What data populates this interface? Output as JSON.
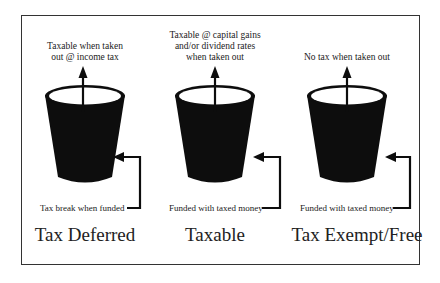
{
  "diagram": {
    "columns": [
      {
        "id": "tax-deferred",
        "top_label": "Taxable when taken\nout @ income tax",
        "bottom_label": "Tax break when funded",
        "title": "Tax Deferred"
      },
      {
        "id": "taxable",
        "top_label": "Taxable @ capital gains\nand/or dividend rates\nwhen taken out",
        "bottom_label": "Funded with taxed money",
        "title": "Taxable"
      },
      {
        "id": "tax-exempt",
        "top_label": "No tax when taken out",
        "bottom_label": "Funded with taxed money",
        "title": "Tax Exempt/Free"
      }
    ],
    "colors": {
      "bucket": "#0d0d0d",
      "frame": "#333333",
      "background": "#ffffff"
    }
  }
}
